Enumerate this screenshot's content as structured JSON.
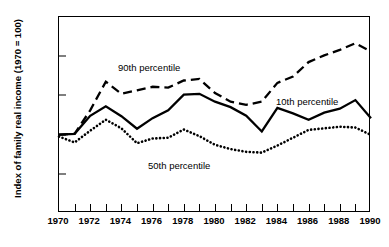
{
  "chart_data": {
    "type": "line",
    "title": "",
    "xlabel": "",
    "ylabel": "Index of family real income (1970 = 100)",
    "xlim": [
      1970,
      1990
    ],
    "ylim": [
      80,
      130
    ],
    "yticks": [
      80,
      90,
      100,
      110,
      120,
      130
    ],
    "ytick_labels": [
      "80",
      "90",
      "100",
      "110",
      "120",
      "130"
    ],
    "xticks": [
      1970,
      1971,
      1972,
      1973,
      1974,
      1975,
      1976,
      1977,
      1978,
      1979,
      1980,
      1981,
      1982,
      1983,
      1984,
      1985,
      1986,
      1987,
      1988,
      1989,
      1990
    ],
    "xtick_labels": [
      "1970",
      "1972",
      "1974",
      "1976",
      "1978",
      "1980",
      "1982",
      "1984",
      "1986",
      "1988",
      "1990"
    ],
    "xtick_labeled_values": [
      1970,
      1972,
      1974,
      1976,
      1978,
      1980,
      1982,
      1984,
      1986,
      1988,
      1990
    ],
    "grid": false,
    "legend_position": "inline-annotation",
    "x": [
      1970,
      1971,
      1972,
      1973,
      1974,
      1975,
      1976,
      1977,
      1978,
      1979,
      1980,
      1981,
      1982,
      1983,
      1984,
      1985,
      1986,
      1987,
      1988,
      1989,
      1990
    ],
    "series": [
      {
        "name": "90th percentile",
        "style": "dashed",
        "color": "#000000",
        "values": [
          100.0,
          100.2,
          106.2,
          113.5,
          110.4,
          111.3,
          112.2,
          112.0,
          113.8,
          114.2,
          110.6,
          108.4,
          107.6,
          108.4,
          113.2,
          114.8,
          118.5,
          120.2,
          121.6,
          123.3,
          121.2
        ]
      },
      {
        "name": "10th percentile",
        "style": "solid",
        "color": "#000000",
        "values": [
          100.0,
          100.2,
          104.8,
          107.2,
          104.7,
          101.5,
          104.2,
          106.2,
          110.2,
          110.4,
          108.4,
          107.0,
          104.8,
          100.8,
          106.8,
          105.4,
          103.8,
          105.6,
          106.6,
          108.8,
          104.2
        ]
      },
      {
        "name": "50th percentile",
        "style": "dotted",
        "color": "#000000",
        "values": [
          99.5,
          98.0,
          101.0,
          103.8,
          101.6,
          97.8,
          99.0,
          99.2,
          101.3,
          99.6,
          97.4,
          96.3,
          95.6,
          95.4,
          97.2,
          99.2,
          101.2,
          101.6,
          102.0,
          101.8,
          99.9
        ]
      }
    ],
    "annotations": [
      {
        "text": "90th percentile",
        "x": 1976.0,
        "y": 117.5
      },
      {
        "text": "10th percentile",
        "x": 1986.5,
        "y": 108.8
      },
      {
        "text": "50th percentile",
        "x": 1977.5,
        "y": 93.5
      }
    ]
  },
  "source_note": ""
}
